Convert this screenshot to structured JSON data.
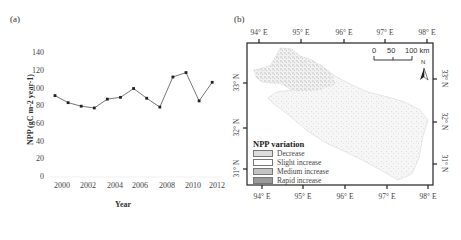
{
  "panel_a": {
    "label": "(a)"
  },
  "panel_b": {
    "label": "(b)",
    "top_lon_ticks": [
      "94° E",
      "95° E",
      "96° E",
      "97° E",
      "98° E"
    ],
    "bottom_lon_ticks": [
      "94° E",
      "95° E",
      "96° E",
      "97° E",
      "98° E"
    ],
    "left_lat_ticks": [
      "33° N",
      "32° N",
      "31° N"
    ],
    "right_lat_ticks": [
      "33° N",
      "32° N",
      "31° N"
    ],
    "scale_bar": {
      "labels": [
        "0",
        "50",
        "100 km"
      ]
    },
    "north_arrow": {
      "label": "N"
    },
    "legend": {
      "title": "NPP variation",
      "items": [
        {
          "label": "Decrease",
          "color": "#dcdcdc"
        },
        {
          "label": "Slight increase",
          "color": "#ffffff"
        },
        {
          "label": "Medium increase",
          "color": "#c4c4c4"
        },
        {
          "label": "Rapid increase",
          "color": "#9a9a9a"
        }
      ]
    }
  },
  "chart_data": [
    {
      "type": "line",
      "title": "",
      "xlabel": "Year",
      "ylabel": "NPP (gC m-2 year-1)",
      "x": [
        2000,
        2001,
        2002,
        2003,
        2004,
        2005,
        2006,
        2007,
        2008,
        2009,
        2010,
        2011,
        2012
      ],
      "values": [
        92,
        84,
        80,
        78,
        88,
        90,
        100,
        89,
        79,
        113,
        118,
        86,
        107
      ],
      "x_tick_labels": [
        "2000",
        "2002",
        "2004",
        "2006",
        "2008",
        "2010",
        "2012"
      ],
      "y_tick_labels": [
        "0",
        "20",
        "40",
        "60",
        "80",
        "100",
        "120",
        "140"
      ],
      "ylim": [
        0,
        140
      ],
      "grid": false,
      "marker": "square",
      "line_color": "#555555"
    },
    {
      "type": "map",
      "title": "NPP variation",
      "legend_entries": [
        "Decrease",
        "Slight increase",
        "Medium increase",
        "Rapid increase"
      ],
      "lon_range": [
        "94° E",
        "98° E"
      ],
      "lat_range": [
        "31° N",
        "33° N"
      ]
    }
  ]
}
